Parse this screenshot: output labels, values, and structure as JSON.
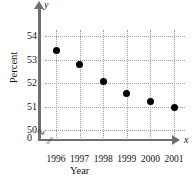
{
  "chart_data": {
    "type": "scatter",
    "title": "",
    "xlabel": "Year",
    "ylabel": "Percent",
    "x_axis_symbol": "x",
    "y_axis_symbol": "y",
    "categories": [
      "1996",
      "1997",
      "1998",
      "1999",
      "2000",
      "2001"
    ],
    "values": [
      53.4,
      52.8,
      52.05,
      51.55,
      51.2,
      50.95
    ],
    "series": [
      {
        "name": "Percent",
        "values": [
          53.4,
          52.8,
          52.05,
          51.55,
          51.2,
          50.95
        ]
      }
    ],
    "y_ticks": [
      "54",
      "53",
      "52",
      "51",
      "50",
      "0"
    ],
    "y_tick_values": [
      54,
      53,
      52,
      51,
      50,
      0
    ],
    "ylim": [
      49.6,
      54.3
    ],
    "axis_break": true,
    "axis_break_symbol": "≈",
    "grid": true,
    "legend": "none",
    "marker": "filled-circle",
    "marker_color": "#000000",
    "grid_color": "#9a9a9a",
    "axis_color": "#6f6f6f"
  }
}
